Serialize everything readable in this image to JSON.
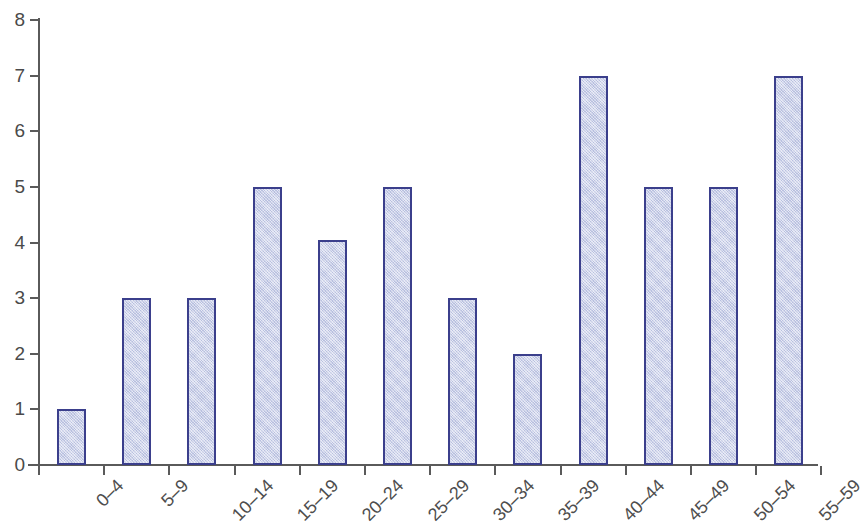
{
  "chart_data": {
    "type": "bar",
    "title": "",
    "subtitle": "",
    "xlabel": "",
    "ylabel": "",
    "categories": [
      "0–4",
      "5–9",
      "10–14",
      "15–19",
      "20–24",
      "25–29",
      "30–34",
      "35–39",
      "40–44",
      "45–49",
      "50–54",
      "55–59"
    ],
    "values": [
      1,
      3,
      3,
      5,
      4.05,
      5,
      3,
      2,
      7,
      5,
      5,
      7
    ],
    "ylim": [
      0,
      8
    ],
    "y_ticks": [
      "0",
      "1",
      "2",
      "3",
      "4",
      "5",
      "6",
      "7",
      "8"
    ],
    "y_tick_values": [
      0,
      1,
      2,
      3,
      4,
      5,
      6,
      7,
      8
    ],
    "grid": false,
    "legend": false,
    "legend_position": "none",
    "bar_fill_color": "#c5cce8",
    "bar_border_color": "#3b3f8c",
    "axis_color": "#5a5a5a",
    "text_color": "#4a4a4a",
    "background_color": "#ffffff",
    "x_label_rotation_degrees": -45
  }
}
